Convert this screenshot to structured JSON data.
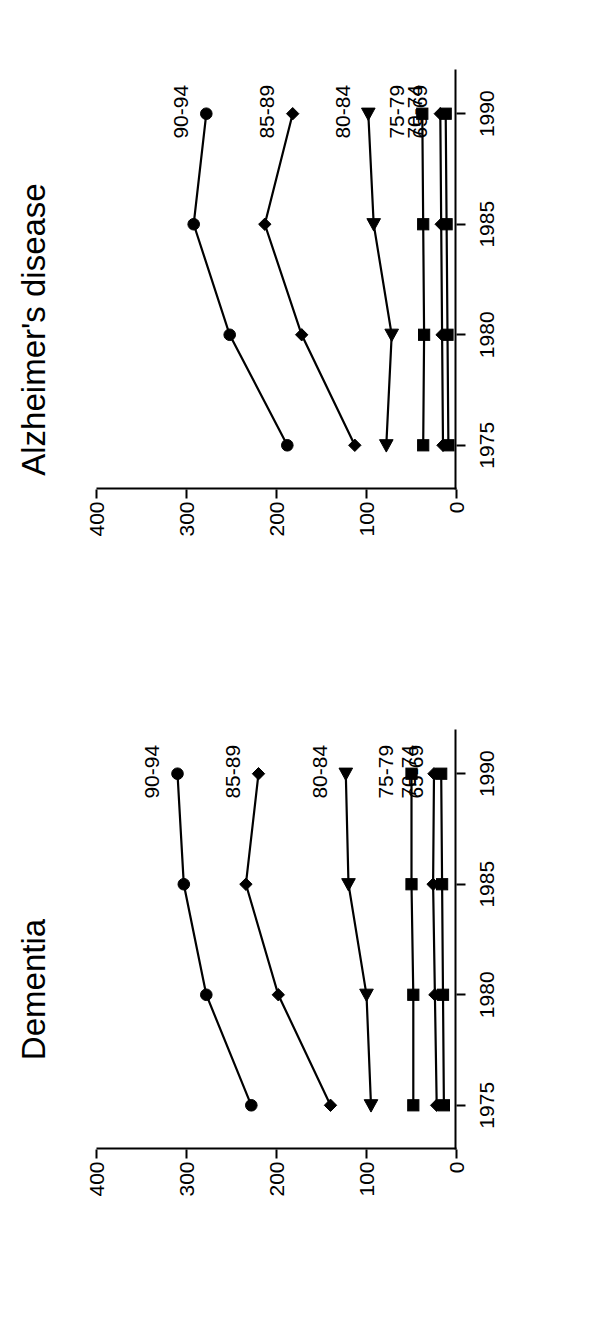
{
  "figure": {
    "orientation": "rotated-90-clockwise",
    "y_axis_label": "Cases/1000",
    "y_ticks": [
      "400",
      "300",
      "200",
      "100",
      "0"
    ],
    "x_ticks": [
      "1975",
      "1980",
      "1985",
      "1990"
    ]
  },
  "panels": [
    {
      "key": "dementia",
      "title": "Dementia"
    },
    {
      "key": "alzheimer",
      "title": "Alzheimer's disease"
    }
  ],
  "series_labels": [
    "90-94",
    "85-89",
    "80-84",
    "75-79",
    "70-74",
    "65-69"
  ],
  "chart_data": [
    {
      "type": "line",
      "title": "Dementia",
      "xlabel": "",
      "ylabel": "Cases/1000",
      "x": [
        1975,
        1980,
        1985,
        1990
      ],
      "xlim": [
        1973,
        1992
      ],
      "ylim": [
        0,
        400
      ],
      "yticks": [
        0,
        100,
        200,
        300,
        400
      ],
      "grid": false,
      "legend": "inline-right-of-last-point",
      "series": [
        {
          "name": "90-94",
          "marker": "circle",
          "values": [
            228,
            278,
            303,
            310
          ]
        },
        {
          "name": "85-89",
          "marker": "diamond",
          "values": [
            140,
            198,
            234,
            220
          ]
        },
        {
          "name": "80-84",
          "marker": "triangle",
          "values": [
            95,
            100,
            120,
            123
          ]
        },
        {
          "name": "75-79",
          "marker": "square",
          "values": [
            48,
            48,
            50,
            50
          ]
        },
        {
          "name": "70-74",
          "marker": "diamond",
          "values": [
            22,
            24,
            26,
            25
          ]
        },
        {
          "name": "65-69",
          "marker": "square",
          "values": [
            14,
            15,
            16,
            17
          ]
        }
      ]
    },
    {
      "type": "line",
      "title": "Alzheimer's disease",
      "xlabel": "",
      "ylabel": "Cases/1000",
      "x": [
        1975,
        1980,
        1985,
        1990
      ],
      "xlim": [
        1973,
        1992
      ],
      "ylim": [
        0,
        400
      ],
      "yticks": [
        0,
        100,
        200,
        300,
        400
      ],
      "grid": false,
      "legend": "inline-right-of-last-point",
      "series": [
        {
          "name": "90-94",
          "marker": "circle",
          "values": [
            188,
            252,
            292,
            278
          ]
        },
        {
          "name": "85-89",
          "marker": "diamond",
          "values": [
            113,
            172,
            213,
            182
          ]
        },
        {
          "name": "80-84",
          "marker": "triangle",
          "values": [
            78,
            72,
            92,
            98
          ]
        },
        {
          "name": "75-79",
          "marker": "square",
          "values": [
            37,
            36,
            37,
            38
          ]
        },
        {
          "name": "70-74",
          "marker": "diamond",
          "values": [
            15,
            16,
            17,
            18
          ]
        },
        {
          "name": "65-69",
          "marker": "square",
          "values": [
            9,
            10,
            11,
            12
          ]
        }
      ]
    }
  ]
}
